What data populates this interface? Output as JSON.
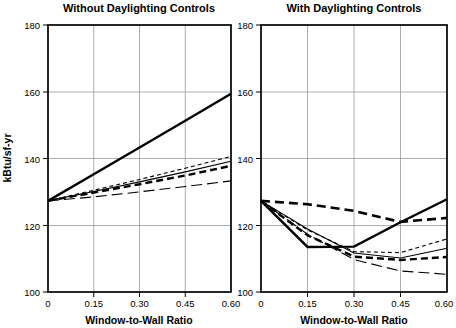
{
  "chart_data": {
    "type": "line",
    "title": "",
    "xlabel": "Window-to-Wall Ratio",
    "ylabel": "kBtu/sf-yr",
    "xlim": [
      0,
      0.6
    ],
    "ylim": [
      100,
      180
    ],
    "x_ticks": [
      "0",
      "0.15",
      "0.30",
      "0.45",
      "0.60"
    ],
    "x_tick_values": [
      0,
      0.15,
      0.3,
      0.45,
      0.6
    ],
    "y_ticks": [
      "100",
      "120",
      "140",
      "160",
      "180"
    ],
    "y_tick_values": [
      100,
      120,
      140,
      160,
      180
    ],
    "grid": true,
    "legend": "none",
    "panels": [
      {
        "title": "Without Daylighting Controls",
        "x": [
          0,
          0.15,
          0.3,
          0.45,
          0.6
        ],
        "series": [
          {
            "name": "solid-thick",
            "style": "solid",
            "width": 2.4,
            "dash": "none",
            "values": [
              127.3,
              135.3,
              143.3,
              151.3,
              159.4
            ]
          },
          {
            "name": "dashed-thick",
            "style": "dashed",
            "width": 2.4,
            "dash": "7,4",
            "values": [
              127.3,
              129.8,
              132.3,
              134.9,
              137.8
            ]
          },
          {
            "name": "dotted-thin-short-dash",
            "style": "short-dash",
            "width": 1.1,
            "dash": "4,3",
            "values": [
              127.3,
              130.5,
              133.7,
              137.1,
              140.6
            ]
          },
          {
            "name": "solid-thin",
            "style": "solid",
            "width": 1.1,
            "dash": "none",
            "values": [
              127.3,
              130.1,
              133.0,
              136.0,
              139.2
            ]
          },
          {
            "name": "long-dash-thin",
            "style": "long-dash",
            "width": 1.1,
            "dash": "11,5",
            "values": [
              127.3,
              128.5,
              130.0,
              131.6,
              133.3
            ]
          }
        ]
      },
      {
        "title": "With Daylighting Controls",
        "x": [
          0,
          0.15,
          0.3,
          0.45,
          0.6
        ],
        "series": [
          {
            "name": "solid-thick",
            "style": "solid",
            "width": 2.4,
            "dash": "none",
            "values": [
              127.3,
              113.5,
              113.6,
              120.9,
              127.8
            ]
          },
          {
            "name": "dashed-thick-upper",
            "style": "long-dash",
            "width": 2.6,
            "dash": "9,5",
            "values": [
              127.3,
              126.3,
              124.3,
              121.0,
              122.2
            ]
          },
          {
            "name": "dashed-thick-lower",
            "style": "dashed",
            "width": 2.4,
            "dash": "7,4",
            "values": [
              127.3,
              117.0,
              110.6,
              109.6,
              110.5
            ]
          },
          {
            "name": "short-dash-thin",
            "style": "short-dash",
            "width": 1.1,
            "dash": "4,3",
            "values": [
              127.3,
              118.6,
              112.1,
              111.8,
              115.9
            ]
          },
          {
            "name": "solid-thin",
            "style": "solid",
            "width": 1.1,
            "dash": "none",
            "values": [
              127.3,
              118.9,
              111.7,
              110.2,
              113.1
            ]
          },
          {
            "name": "long-dash-thin",
            "style": "long-dash",
            "width": 1.1,
            "dash": "11,5",
            "values": [
              127.3,
              117.3,
              109.7,
              106.3,
              105.3
            ]
          }
        ]
      }
    ]
  }
}
